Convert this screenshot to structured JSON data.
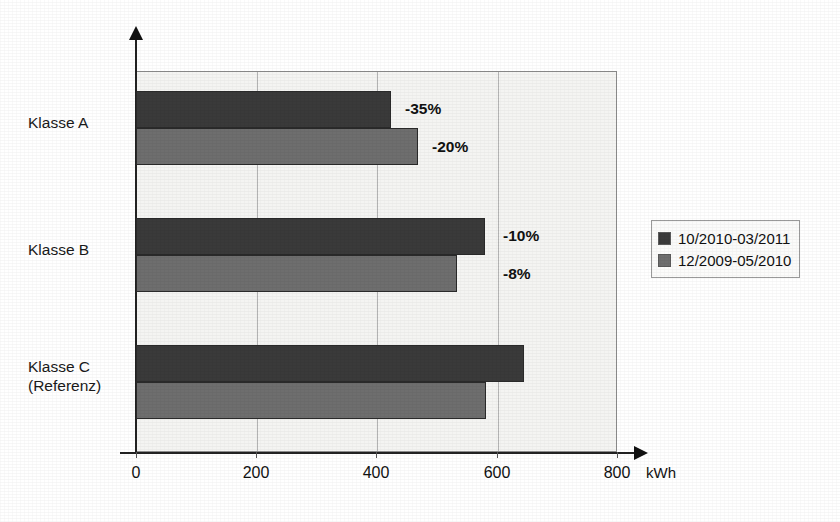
{
  "chart_data": {
    "type": "bar",
    "orientation": "horizontal",
    "title": "",
    "subtitle": "",
    "xlabel": "kWh",
    "ylabel": "",
    "xlim": [
      0,
      800
    ],
    "xticks": [
      0,
      200,
      400,
      600,
      800
    ],
    "xtick_labels": [
      "0",
      "200",
      "400",
      "600",
      "800"
    ],
    "grid": "vertical",
    "legend_position": "right",
    "categories": [
      "Klasse A",
      "Klasse B",
      "Klasse C\n(Referenz)"
    ],
    "category_labels": [
      {
        "line1": "Klasse A",
        "line2": ""
      },
      {
        "line1": "Klasse B",
        "line2": ""
      },
      {
        "line1": "Klasse C",
        "line2": "(Referenz)"
      }
    ],
    "series": [
      {
        "name": "10/2010-03/2011",
        "color": "#3a3a3a",
        "values": [
          424,
          580,
          645
        ],
        "data_labels": [
          "-35%",
          "-10%",
          ""
        ]
      },
      {
        "name": "12/2009-05/2010",
        "color": "#6e6e6e",
        "values": [
          469,
          534,
          582
        ],
        "data_labels": [
          "-20%",
          "-8%",
          ""
        ]
      }
    ],
    "annotations": [
      {
        "text": "-35%",
        "series": "10/2010-03/2011",
        "category": "Klasse A"
      },
      {
        "text": "-20%",
        "series": "12/2009-05/2010",
        "category": "Klasse A"
      },
      {
        "text": "-10%",
        "series": "10/2010-03/2011",
        "category": "Klasse B"
      },
      {
        "text": "-8%",
        "series": "12/2009-05/2010",
        "category": "Klasse B"
      }
    ]
  },
  "legend": {
    "items": [
      {
        "label": "10/2010-03/2011",
        "color": "#3a3a3a"
      },
      {
        "label": "12/2009-05/2010",
        "color": "#6e6e6e"
      }
    ]
  },
  "axis": {
    "x_unit": "kWh",
    "ticks": [
      "0",
      "200",
      "400",
      "600",
      "800"
    ]
  },
  "colors": {
    "series_dark": "#3a3a3a",
    "series_gray": "#6e6e6e",
    "plot_background": "#f4f4f2",
    "gridline": "#b4b4b4",
    "axis": "#222222",
    "text": "#1a1a1a"
  }
}
